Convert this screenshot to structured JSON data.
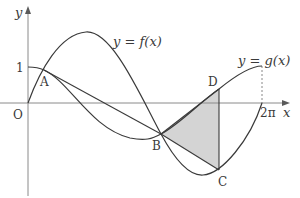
{
  "diagram": {
    "type": "function-graph",
    "axes": {
      "x_label": "x",
      "y_label": "y",
      "origin_label": "O",
      "y_tick_label": "1",
      "x_tick_label": "2π"
    },
    "curves": [
      {
        "name": "f",
        "label": "y = f(x)",
        "shape": "sine-like: starts at O, rises to max, falls through B to min, returns to axis at 2π"
      },
      {
        "name": "g",
        "label": "y = g(x)",
        "shape": "cosine-like: starts at (0,1), passes A, dips through B to min, rises through D to (2π,1)"
      }
    ],
    "points": {
      "A": "A",
      "B": "B",
      "C": "C",
      "D": "D"
    },
    "segments": [
      "AB",
      "BD",
      "BC",
      "DC"
    ],
    "shaded_region": "triangle BDC",
    "dashed_guide": "vertical from x = 2π to g(2π)",
    "colors": {
      "stroke": "#3a3a3a",
      "axis": "#8a8a8a",
      "shade": "#d4d4d4"
    }
  },
  "labels": {
    "f_eq": "y = f(x)",
    "g_eq": "y = g(x)",
    "f_prefix": "y = f(",
    "f_var": "x",
    "f_suffix": ")",
    "g_prefix": "y = g(",
    "g_var": "x",
    "g_suffix": ")"
  }
}
